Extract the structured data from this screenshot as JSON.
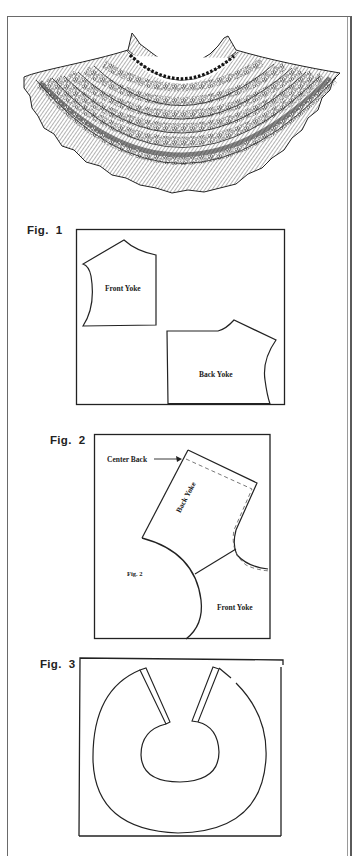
{
  "illustration": {
    "subject": "ruffled crocheted lace collar"
  },
  "figures": [
    {
      "label": "Fig.  1",
      "pieces": [
        {
          "label": "Front Yoke"
        },
        {
          "label": "Back Yoke"
        }
      ]
    },
    {
      "label": "Fig.  2",
      "annotations": {
        "center_back": "Center Back",
        "back_yoke": "Back Yoke",
        "inner_label": "Fig. 2",
        "front_yoke": "Front Yoke"
      }
    },
    {
      "label": "Fig.  3",
      "shape": "circular collar pattern with center-back opening"
    }
  ],
  "colors": {
    "ink": "#222222",
    "paper": "#ffffff",
    "frame": "#6a6a6a"
  }
}
